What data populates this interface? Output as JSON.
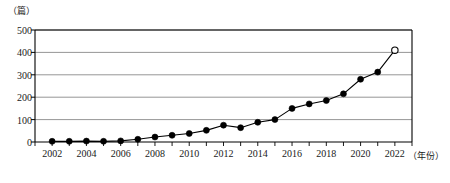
{
  "chart_data": {
    "type": "line",
    "title": "",
    "xlabel": "（年份）",
    "ylabel": "（篇）",
    "ylim": [
      0,
      500
    ],
    "xlim": [
      2001,
      2023
    ],
    "grid": true,
    "legend": null,
    "y_ticks": [
      500,
      400,
      300,
      200,
      100,
      0
    ],
    "x_ticks": [
      2002,
      2004,
      2006,
      2008,
      2010,
      2012,
      2014,
      2016,
      2018,
      2020,
      2022
    ],
    "x": [
      2002,
      2003,
      2004,
      2005,
      2006,
      2007,
      2008,
      2009,
      2010,
      2011,
      2012,
      2013,
      2014,
      2015,
      2016,
      2017,
      2018,
      2019,
      2020,
      2021,
      2022
    ],
    "values": [
      3,
      3,
      4,
      3,
      5,
      12,
      22,
      30,
      38,
      52,
      75,
      64,
      88,
      100,
      150,
      170,
      185,
      215,
      280,
      312,
      410
    ],
    "marker_style": "filled-circle",
    "last_point_marker": "open-circle",
    "last_point_year": 2022,
    "last_point_value": 410,
    "line_color": "#000000",
    "grid_color": "#8a8a8a",
    "axis_color": "#000000"
  },
  "axis": {
    "y_unit_label": "（篇）",
    "x_unit_label": "（年份）"
  }
}
